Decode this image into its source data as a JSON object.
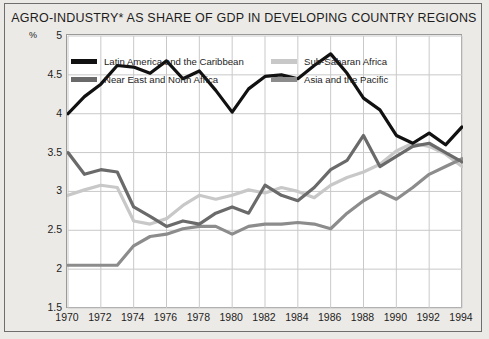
{
  "chart_data": {
    "type": "line",
    "title": "AGRO-INDUSTRY* AS SHARE OF GDP IN DEVELOPING COUNTRY REGIONS",
    "xlabel": "",
    "ylabel": "%",
    "ylim": [
      1.5,
      5
    ],
    "yticks": [
      1.5,
      2,
      2.5,
      3,
      3.5,
      4,
      4.5,
      5
    ],
    "ytick_labels": [
      "1.5",
      "2",
      "2.5",
      "3",
      "3.5",
      "4",
      "4.5",
      "5"
    ],
    "xlim": [
      1970,
      1994
    ],
    "x": [
      1970,
      1971,
      1972,
      1973,
      1974,
      1975,
      1976,
      1977,
      1978,
      1979,
      1980,
      1981,
      1982,
      1983,
      1984,
      1985,
      1986,
      1987,
      1988,
      1989,
      1990,
      1991,
      1992,
      1993,
      1994
    ],
    "xtick_labels": [
      "1970",
      "1972",
      "1974",
      "1976",
      "1978",
      "1980",
      "1982",
      "1984",
      "1986",
      "1988",
      "1990",
      "1992",
      "1994"
    ],
    "xticks": [
      1970,
      1972,
      1974,
      1976,
      1978,
      1980,
      1982,
      1984,
      1986,
      1988,
      1990,
      1992,
      1994
    ],
    "grid": true,
    "legend_position": "top-inside",
    "series": [
      {
        "name": "Latin America and the Caribbean",
        "color": "#111111",
        "values": [
          4.0,
          4.22,
          4.38,
          4.62,
          4.6,
          4.52,
          4.68,
          4.45,
          4.55,
          4.3,
          4.02,
          4.32,
          4.48,
          4.5,
          4.45,
          4.62,
          4.77,
          4.52,
          4.2,
          4.05,
          3.72,
          3.62,
          3.75,
          3.6,
          3.83
        ]
      },
      {
        "name": "Near East and North Africa",
        "color": "#6a6a6a",
        "values": [
          3.5,
          3.22,
          3.28,
          3.25,
          2.8,
          2.68,
          2.55,
          2.62,
          2.58,
          2.72,
          2.8,
          2.72,
          3.08,
          2.95,
          2.88,
          3.05,
          3.28,
          3.4,
          3.72,
          3.32,
          3.45,
          3.58,
          3.62,
          3.5,
          3.38
        ]
      },
      {
        "name": "Sub-Saharan Africa",
        "color": "#c8c8c8",
        "values": [
          2.95,
          3.02,
          3.08,
          3.05,
          2.62,
          2.58,
          2.65,
          2.82,
          2.95,
          2.9,
          2.95,
          3.02,
          2.98,
          3.05,
          3.0,
          2.92,
          3.08,
          3.18,
          3.25,
          3.35,
          3.52,
          3.62,
          3.58,
          3.48,
          3.32
        ]
      },
      {
        "name": "Asia and the Pacific",
        "color": "#8c8c8c",
        "values": [
          2.05,
          2.05,
          2.05,
          2.05,
          2.3,
          2.42,
          2.45,
          2.52,
          2.55,
          2.55,
          2.45,
          2.55,
          2.58,
          2.58,
          2.6,
          2.58,
          2.52,
          2.72,
          2.88,
          3.0,
          2.9,
          3.05,
          3.22,
          3.32,
          3.42
        ]
      }
    ]
  },
  "legend": {
    "columns": [
      {
        "items": [
          {
            "label": "Latin America and the Caribbean",
            "color": "#111111"
          },
          {
            "label": "Near East and North Africa",
            "color": "#6a6a6a"
          }
        ]
      },
      {
        "items": [
          {
            "label": "Sub-Saharan Africa",
            "color": "#c8c8c8"
          },
          {
            "label": "Asia and the Pacific",
            "color": "#8c8c8c"
          }
        ]
      }
    ]
  }
}
